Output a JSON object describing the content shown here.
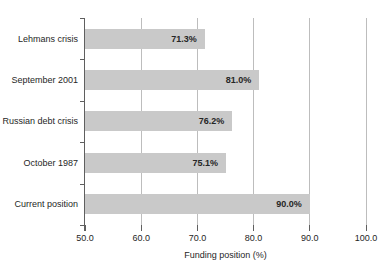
{
  "chart_data": {
    "type": "bar",
    "orientation": "horizontal",
    "categories": [
      "Lehmans crisis",
      "September 2001",
      "Russian debt crisis",
      "October 1987",
      "Current position"
    ],
    "values": [
      71.3,
      81.0,
      76.2,
      75.1,
      90.0
    ],
    "value_labels": [
      "71.3%",
      "81.0%",
      "76.2%",
      "75.1%",
      "90.0%"
    ],
    "title": "",
    "xlabel": "Funding position (%)",
    "ylabel": "",
    "xlim": [
      50.0,
      100.0
    ],
    "xticks": [
      50.0,
      60.0,
      70.0,
      80.0,
      90.0,
      100.0
    ],
    "xtick_labels": [
      "50.0",
      "60.0",
      "70.0",
      "80.0",
      "90.0",
      "100.0"
    ],
    "grid": true,
    "legend": false,
    "colors": {
      "bar_fill": "#c9c9c9",
      "gridline": "#bdbdbd",
      "axis_line": "#5f5f5f",
      "text": "#262626"
    }
  }
}
